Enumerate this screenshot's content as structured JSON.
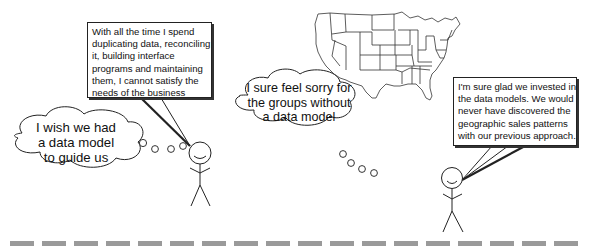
{
  "figures": {
    "left_person": {
      "speech": {
        "lines": [
          "With all the time I spend",
          "duplicating data, reconciling",
          "it, building interface",
          "programs and maintaining",
          "them, I cannot satisfy the",
          "needs of the business"
        ]
      },
      "thought": {
        "lines": [
          "I wish we had",
          "a data model",
          "to guide us"
        ]
      }
    },
    "middle_thought": {
      "lines": [
        "I sure feel sorry for",
        "the groups without",
        "a data model"
      ]
    },
    "right_person": {
      "speech": {
        "lines": [
          "I'm sure glad we invested in",
          "the data models.  We would",
          "never have discovered the",
          "geographic sales patterns",
          "with our previous approach."
        ]
      }
    }
  },
  "map": {
    "label": "us-states-map"
  },
  "ground": {
    "dash_count": 18,
    "color": "#9a9a9a"
  },
  "colors": {
    "ink": "#222222",
    "background": "#ffffff",
    "ground": "#9a9a9a"
  }
}
